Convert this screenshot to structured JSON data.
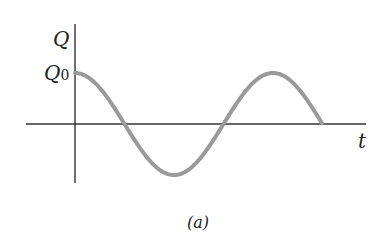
{
  "diagram": {
    "y_axis_label": "Q",
    "y_marker_label": "Q",
    "y_marker_subscript": "0",
    "x_axis_label": "t",
    "caption": "(a)",
    "curve": "cosine",
    "colors": {
      "axis": "#333333",
      "curve": "#9a9a9a"
    }
  }
}
